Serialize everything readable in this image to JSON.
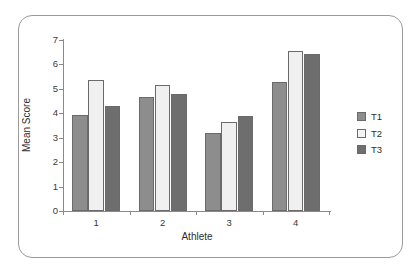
{
  "chart_data": {
    "type": "bar",
    "title": "",
    "xlabel": "Athlete",
    "ylabel": "Mean Score",
    "categories": [
      "1",
      "2",
      "3",
      "4"
    ],
    "series": [
      {
        "name": "T1",
        "values": [
          3.93,
          4.65,
          3.21,
          5.3
        ],
        "color": "#8d8d8d"
      },
      {
        "name": "T2",
        "values": [
          5.37,
          5.15,
          3.64,
          6.57
        ],
        "color": "#f0f0f0"
      },
      {
        "name": "T3",
        "values": [
          4.3,
          4.8,
          3.87,
          6.43
        ],
        "color": "#6e6e6e"
      }
    ],
    "ylim": [
      0,
      7
    ],
    "yticks": [
      "0",
      "1",
      "2",
      "3",
      "4",
      "5",
      "6",
      "7"
    ],
    "grid": false,
    "legend_position": "right"
  },
  "legend": {
    "entries": [
      {
        "label": "T1"
      },
      {
        "label": "T2"
      },
      {
        "label": "T3"
      }
    ]
  },
  "frame": {
    "border_color": "#9a9a9a",
    "background": "#ffffff"
  }
}
